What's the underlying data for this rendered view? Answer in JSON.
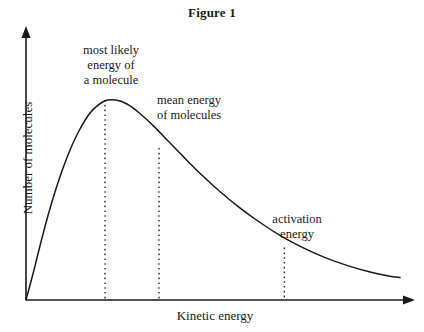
{
  "figure": {
    "title": "Figure 1"
  },
  "axes": {
    "x_label": "Kinetic energy",
    "y_label": "Number of molecules",
    "axis_color": "#1a1a1a"
  },
  "annotations": {
    "most_likely": {
      "line1": "most likely",
      "line2": "energy of",
      "line3": "a molecule"
    },
    "mean_energy": {
      "line1": "mean energy",
      "line2": "of molecules"
    },
    "activation": {
      "line1": "activation",
      "line2": "energy"
    }
  },
  "chart_data": {
    "type": "line",
    "title": "Figure 1",
    "subtitle": "",
    "xlabel": "Kinetic energy",
    "ylabel": "Number of molecules",
    "grid": false,
    "legend": false,
    "axis_ticks": false,
    "axis_arrows": true,
    "xlim": [
      0,
      1
    ],
    "ylim": [
      0,
      1
    ],
    "series": [
      {
        "name": "Maxwell-Boltzmann distribution",
        "color": "#1a1a1a",
        "x": [
          0.0,
          0.02,
          0.04,
          0.06,
          0.08,
          0.1,
          0.12,
          0.14,
          0.16,
          0.18,
          0.21,
          0.24,
          0.27,
          0.3,
          0.34,
          0.38,
          0.42,
          0.47,
          0.52,
          0.57,
          0.62,
          0.68,
          0.74,
          0.8,
          0.86,
          0.92,
          0.97,
          1.0
        ],
        "y": [
          0.0,
          0.14,
          0.29,
          0.43,
          0.555,
          0.665,
          0.76,
          0.84,
          0.905,
          0.953,
          0.995,
          1.0,
          0.98,
          0.94,
          0.872,
          0.795,
          0.718,
          0.625,
          0.54,
          0.463,
          0.395,
          0.322,
          0.262,
          0.212,
          0.172,
          0.14,
          0.12,
          0.112
        ]
      }
    ],
    "markers": [
      {
        "id": "most-likely-energy",
        "label": "most likely energy of a molecule",
        "x": 0.2113,
        "y_top": 1.0,
        "style": "dotted-vertical"
      },
      {
        "id": "mean-energy",
        "label": "mean energy of molecules",
        "x": 0.3557,
        "y_top": 0.76,
        "style": "dotted-vertical"
      },
      {
        "id": "activation-energy",
        "label": "activation energy",
        "x": 0.6907,
        "y_top": 0.262,
        "style": "dotted-vertical"
      }
    ]
  }
}
